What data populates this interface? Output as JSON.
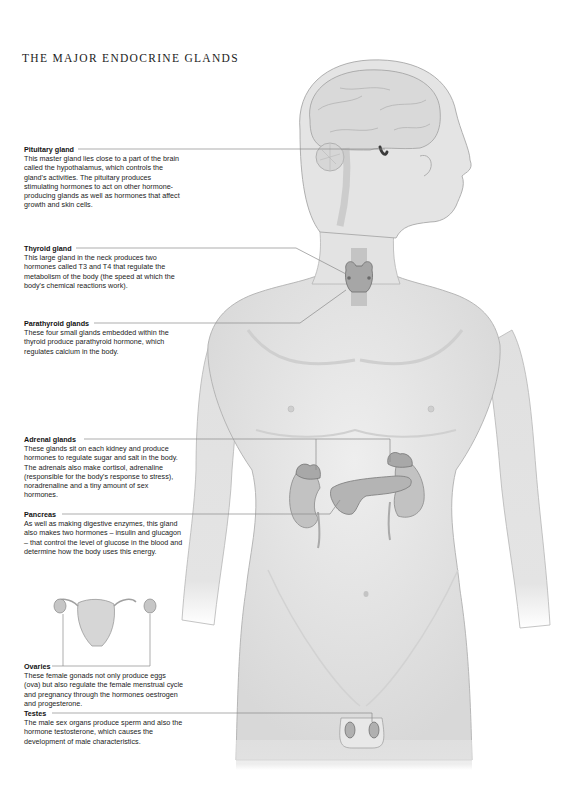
{
  "title": "THE MAJOR ENDOCRINE GLANDS",
  "glands": [
    {
      "name": "Pituitary gland",
      "description": "This master gland lies close to a part of the brain called the hypothalamus, which controls the gland's activities. The pituitary produces stimulating hormones to act on other hormone-producing glands as well as hormones that affect growth and skin cells."
    },
    {
      "name": "Thyroid gland",
      "description": "This large gland in the neck produces two hormones called T3 and T4 that regulate the metabolism of the body (the speed at which the body's chemical reactions work)."
    },
    {
      "name": "Parathyroid glands",
      "description": "These four small glands embedded within the thyroid produce parathyroid hormone, which regulates calcium in the body."
    },
    {
      "name": "Adrenal glands",
      "description": "These glands sit on each kidney and produce hormones to regulate sugar and salt in the body. The adrenals also make cortisol, adrenaline (responsible for the body's response to stress), noradrenaline and a tiny amount of sex hormones."
    },
    {
      "name": "Pancreas",
      "description": "As well as making digestive enzymes, this gland also makes two hormones – insulin and glucagon – that control the level of glucose in the blood and determine how the body uses this energy."
    },
    {
      "name": "Ovaries",
      "description": "These female gonads not only produce eggs (ova) but also regulate the female menstrual cycle and pregnancy through the hormones oestrogen and progesterone."
    },
    {
      "name": "Testes",
      "description": "The male sex organs produce sperm and also the hormone testosterone, which causes the development of male characteristics."
    }
  ],
  "colors": {
    "skin": "#e6e6e6",
    "skin_shadow": "#c9c9c9",
    "outline": "#9a9a9a",
    "gland": "#a8a8a8",
    "gland_dark": "#5a5a5a",
    "leader_line": "#8a8a8a"
  }
}
